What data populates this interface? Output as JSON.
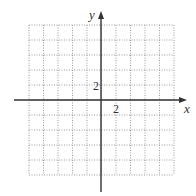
{
  "diagram": {
    "type": "coordinate-grid",
    "axes": {
      "x_label": "x",
      "y_label": "y",
      "x_tick_label": "2",
      "y_tick_label": "2"
    },
    "grid": {
      "columns": 10,
      "rows": 10,
      "unit_per_line": 2,
      "x_range": [
        -10,
        10
      ],
      "y_range": [
        -10,
        10
      ],
      "line_style": "dotted"
    },
    "colors": {
      "axis": "#333333",
      "grid": "#9a9a9a",
      "background": "#ffffff"
    }
  }
}
